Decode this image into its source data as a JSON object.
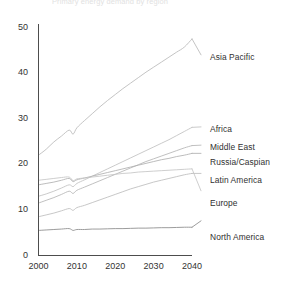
{
  "chart_data": {
    "type": "line",
    "title": "Primary energy demand by region",
    "xlabel": "",
    "ylabel": "",
    "xlim": [
      2000,
      2040
    ],
    "ylim": [
      0,
      50
    ],
    "grid": false,
    "legend_position": "right-inline-labels",
    "xticks": [
      "2000",
      "2010",
      "2020",
      "2030",
      "2040"
    ],
    "yticks": [
      "0",
      "10",
      "20",
      "30",
      "40",
      "50"
    ],
    "x": [
      2000,
      2002,
      2004,
      2006,
      2008,
      2009,
      2010,
      2012,
      2014,
      2016,
      2018,
      2020,
      2022,
      2024,
      2026,
      2028,
      2030,
      2032,
      2034,
      2036,
      2038,
      2040
    ],
    "series": [
      {
        "name": "Asia Pacific",
        "color": "#b9b9b9",
        "label_x": 2044,
        "label_y": 44.0,
        "values": [
          22.0,
          23.3,
          24.9,
          26.2,
          27.5,
          26.6,
          28.0,
          29.6,
          31.1,
          32.6,
          34.0,
          35.3,
          36.6,
          37.8,
          39.0,
          40.2,
          41.3,
          42.4,
          43.5,
          44.6,
          45.7,
          47.5
        ]
      },
      {
        "name": "Africa",
        "color": "#c0c0c0",
        "label_x": 2044,
        "label_y": 28.2,
        "values": [
          13.0,
          13.5,
          14.1,
          14.8,
          15.5,
          15.1,
          15.8,
          16.6,
          17.4,
          18.2,
          19.0,
          19.8,
          20.6,
          21.4,
          22.2,
          23.0,
          23.8,
          24.6,
          25.4,
          26.3,
          27.2,
          28.1
        ]
      },
      {
        "name": "Middle East",
        "color": "#b5b5b5",
        "label_x": 2044,
        "label_y": 24.2,
        "values": [
          11.5,
          12.1,
          12.7,
          13.4,
          14.1,
          13.6,
          14.3,
          15.0,
          15.7,
          16.4,
          17.1,
          17.8,
          18.5,
          19.2,
          19.9,
          20.6,
          21.2,
          21.8,
          22.4,
          23.0,
          23.6,
          24.1
        ]
      },
      {
        "name": "Russia/Caspian",
        "color": "#b0b0b0",
        "label_x": 2044,
        "label_y": 22.4,
        "values": [
          15.5,
          15.8,
          16.1,
          16.5,
          16.9,
          16.2,
          16.6,
          17.0,
          17.4,
          17.8,
          18.2,
          18.6,
          19.0,
          19.4,
          19.8,
          20.2,
          20.6,
          21.0,
          21.3,
          21.7,
          22.0,
          22.4
        ]
      },
      {
        "name": "Latin America",
        "color": "#bdbdbd",
        "label_x": 2044,
        "label_y": 18.0,
        "values": [
          8.5,
          8.9,
          9.3,
          9.8,
          10.3,
          9.9,
          10.5,
          11.0,
          11.6,
          12.2,
          12.8,
          13.4,
          14.0,
          14.6,
          15.1,
          15.6,
          16.1,
          16.5,
          16.9,
          17.3,
          17.7,
          18.0
        ]
      },
      {
        "name": "Europe",
        "color": "#c5c5c5",
        "label_x": 2044,
        "label_y": 14.2,
        "values": [
          16.5,
          16.7,
          16.9,
          17.1,
          17.2,
          16.4,
          16.8,
          17.0,
          17.2,
          17.4,
          17.6,
          17.8,
          18.0,
          18.1,
          18.3,
          18.4,
          18.5,
          18.6,
          18.7,
          18.8,
          18.9,
          19.0
        ]
      },
      {
        "name": "North America",
        "color": "#8a8a8a",
        "label_x": 2044,
        "label_y": 7.6,
        "values": [
          5.5,
          5.6,
          5.7,
          5.8,
          5.9,
          5.5,
          5.7,
          5.7,
          5.8,
          5.8,
          5.85,
          5.9,
          5.9,
          5.95,
          6.0,
          6.0,
          6.05,
          6.1,
          6.1,
          6.15,
          6.2,
          6.2
        ]
      }
    ]
  }
}
